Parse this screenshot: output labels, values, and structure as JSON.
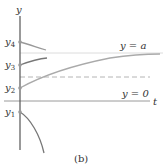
{
  "figure": {
    "caption": "(b)",
    "axes": {
      "y_label": "y",
      "t_label": "t"
    },
    "lines": {
      "equilibrium_a_label": "y = a",
      "equilibrium_0_label": "y = 0"
    },
    "initial_values": [
      {
        "label": "y",
        "sub": "4"
      },
      {
        "label": "y",
        "sub": "3"
      },
      {
        "label": "y",
        "sub": "2"
      },
      {
        "label": "y",
        "sub": "1"
      }
    ],
    "colors": {
      "axis": "#555555",
      "curve": "#8a8a8a",
      "guide": "#d8d8d8",
      "dashed": "#b0b0b0"
    }
  }
}
